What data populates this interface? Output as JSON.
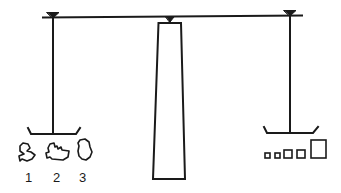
{
  "diagram": {
    "colors": {
      "stroke": "#1a1a1a",
      "background": "#ffffff"
    },
    "objects": [
      {
        "id": 1,
        "label": "1",
        "shape": "irregular-object"
      },
      {
        "id": 2,
        "label": "2",
        "shape": "irregular-object"
      },
      {
        "id": 3,
        "label": "3",
        "shape": "irregular-object"
      }
    ],
    "weights": [
      {
        "size": "small"
      },
      {
        "size": "small"
      },
      {
        "size": "medium"
      },
      {
        "size": "medium"
      },
      {
        "size": "large"
      }
    ]
  }
}
